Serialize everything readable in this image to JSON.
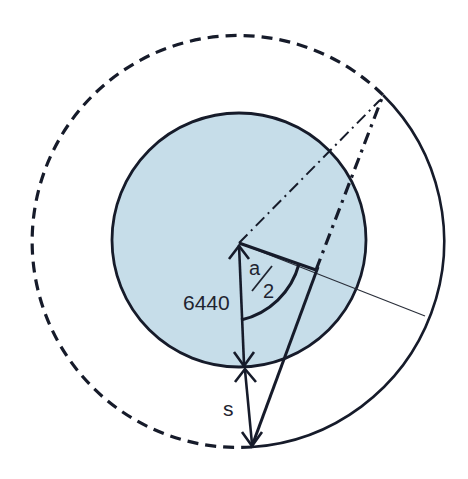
{
  "diagram": {
    "labels": {
      "radius": "6440",
      "half_angle_num": "a",
      "half_angle_den": "2",
      "altitude": "s"
    },
    "colors": {
      "earth_fill": "#c6dde9",
      "stroke": "#161b2a",
      "background": "#ffffff"
    }
  }
}
